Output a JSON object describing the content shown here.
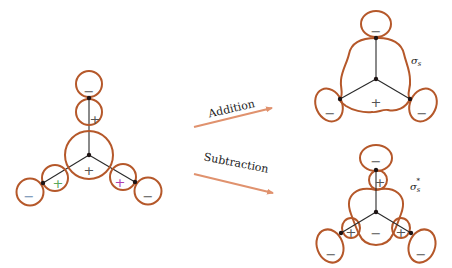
{
  "colors": {
    "lobe": "#b5582a",
    "arrow": "#e0926e",
    "bond": "#2a2a2a",
    "sign_default": "#555555",
    "sign_green": "#5aa85a",
    "sign_magenta": "#b040b0",
    "sign_blue": "#6a8ab0"
  },
  "left_orbitals": {
    "signs": {
      "top_outer": "−",
      "top_inner": "+",
      "center": "+",
      "left_inner": "+",
      "left_outer": "−",
      "right_inner": "+",
      "right_outer": "−"
    }
  },
  "arrows": {
    "addition": {
      "label": "Addition"
    },
    "subtraction": {
      "label": "Subtraction"
    }
  },
  "bonding": {
    "label_main": "σ",
    "label_sub": "s",
    "signs": {
      "top": "−",
      "center": "+",
      "left": "−",
      "right": "−"
    }
  },
  "antibonding": {
    "label_main": "σ",
    "label_sub": "s",
    "label_sup": "*",
    "signs": {
      "top_outer": "−",
      "top_inner": "+",
      "center": "−",
      "left_inner": "+",
      "left_outer": "−",
      "right_inner": "+",
      "right_outer": "−"
    }
  }
}
